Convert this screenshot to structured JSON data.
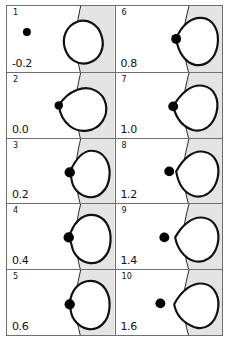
{
  "figure": {
    "type": "multi-panel-sequence",
    "panel_count": 10,
    "columns": 2,
    "rows": 5,
    "colors": {
      "ink": "#111111",
      "frame": "#6f6f6f",
      "shading": "#e4e4e4",
      "background": "#ffffff",
      "marker": "#000000"
    },
    "shared": {
      "interface_label": "wavy-interface-curve",
      "marker_label": "black-dot-marker",
      "blob_label": "closed-contour-blob",
      "shaded_side": "right"
    }
  },
  "panels": [
    {
      "index": "1",
      "value": "-0.2",
      "dot": {
        "cx": 20,
        "cy": 26,
        "r": 4.0
      },
      "blob": "M 70 16 C 80 12, 92 18, 95 30 C 99 42, 93 54, 82 57 C 71 60, 61 53, 58 42 C 55 31, 60 20, 70 16 Z",
      "interface": "M 74 0 C 71 14, 69 26, 69 34 C 69 44, 71 56, 74 68",
      "shade_x": 69
    },
    {
      "index": "2",
      "value": "0.0",
      "dot": {
        "cx": 52,
        "cy": 33,
        "r": 4.3
      },
      "blob": "M 52 33 C 62 17, 78 12, 89 18 C 100 24, 103 38, 96 49 C 89 60, 73 62, 63 54 C 57 49, 53 41, 52 33 Z",
      "interface": "M 74 0 C 71 12, 69 24, 69 33 C 69 44, 71 56, 74 68",
      "shade_x": 69
    },
    {
      "index": "3",
      "value": "0.2",
      "dot": {
        "cx": 63,
        "cy": 34,
        "r": 5.2
      },
      "blob": "M 63 34 C 69 20, 76 12, 85 12 C 97 12, 104 24, 103 37 C 102 52, 92 61, 81 59 C 72 57, 66 50, 65 42 C 64.5 38, 64 36, 63 34 Z",
      "interface": "M 74 0 C 71 12, 69 24, 69 34 C 69 45, 71 57, 74 68",
      "shade_x": 69
    },
    {
      "index": "4",
      "value": "0.4",
      "dot": {
        "cx": 62,
        "cy": 34,
        "r": 5.2
      },
      "blob": "M 62 34 C 67 19, 75 11, 85 11 C 98 11, 105 24, 104 38 C 103 53, 93 62, 82 60 C 72 58, 66 50, 65 42 C 64 38, 63 36, 62 34 Z",
      "interface": "M 74 0 C 71 12, 69 24, 69 34 C 69 45, 71 57, 74 68",
      "shade_x": 69
    },
    {
      "index": "5",
      "value": "0.6",
      "dot": {
        "cx": 63,
        "cy": 35,
        "r": 5.2
      },
      "blob": "M 63 35 C 64 20, 73 11, 84 11 C 97 11, 104 24, 103 38 C 102 53, 92 62, 81 60 C 71 58, 65 49, 64 41 C 63.5 38, 63 36, 63 35 Z",
      "interface": "M 74 0 C 71 12, 69 24, 69 35 C 69 46, 71 57, 74 68",
      "shade_x": 69
    },
    {
      "index": "6",
      "value": "0.8",
      "dot": {
        "cx": 61,
        "cy": 33,
        "r": 5.0
      },
      "blob": "M 61 33 C 66 20, 76 11, 87 12 C 99 13, 105 25, 103 39 C 101 53, 91 61, 80 59 C 70 57, 63 46, 61 33 Z",
      "interface": "M 74 0 C 71 12, 68 24, 68 34 C 68 45, 71 57, 74 68",
      "shade_x": 68
    },
    {
      "index": "7",
      "value": "1.0",
      "dot": {
        "cx": 58,
        "cy": 34,
        "r": 5.0
      },
      "blob": "M 58 34 C 66 20, 77 11, 88 13 C 100 15, 105 27, 102 40 C 99 53, 89 61, 78 58 C 68 55, 61 46, 58 34 Z",
      "interface": "M 74 0 C 71 12, 68 24, 68 34 C 68 45, 71 57, 74 68",
      "shade_x": 68
    },
    {
      "index": "8",
      "value": "1.2",
      "dot": {
        "cx": 54,
        "cy": 33,
        "r": 5.0
      },
      "blob": "M 61 33 C 68 20, 78 11, 89 13 C 101 15, 106 27, 103 40 C 100 53, 90 61, 79 58 C 69 55, 63 45, 61 33 Z",
      "interface": "M 74 0 C 71 12, 68 24, 68 34 C 68 45, 71 57, 74 68",
      "shade_x": 68
    },
    {
      "index": "9",
      "value": "1.4",
      "dot": {
        "cx": 49,
        "cy": 34,
        "r": 5.0
      },
      "blob": "M 60 34 C 67 21, 78 12, 89 14 C 101 16, 106 28, 103 41 C 100 54, 90 61, 79 58 C 69 55, 62 45, 60 34 Z",
      "interface": "M 74 0 C 71 12, 68 24, 68 34 C 68 45, 71 57, 74 68",
      "shade_x": 68
    },
    {
      "index": "10",
      "value": "1.6",
      "dot": {
        "cx": 45,
        "cy": 34,
        "r": 5.0
      },
      "blob": "M 59 35 C 66 21, 78 12, 89 14 C 101 16, 106 29, 103 42 C 100 55, 90 62, 79 58 C 69 54, 61 46, 59 35 Z",
      "interface": "M 74 0 C 71 12, 68 25, 68 35 C 68 46, 71 57, 74 68",
      "shade_x": 68
    }
  ]
}
